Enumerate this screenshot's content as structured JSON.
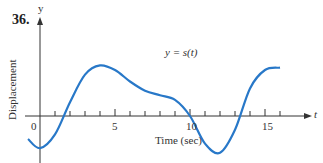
{
  "problem_number": "36.",
  "chart_data": {
    "type": "line",
    "title": "",
    "curve_label": "y = s(t)",
    "xlabel": "Time (sec)",
    "ylabel": "Displacement",
    "x_axis_name": "t",
    "y_axis_name": "y",
    "x_ticks": [
      0,
      5,
      10,
      15
    ],
    "minor_tick_step": 1,
    "xlim": [
      -1,
      17
    ],
    "series": [
      {
        "name": "s(t)",
        "color": "#2878c8",
        "x": [
          -0.8,
          0,
          1,
          2,
          3,
          4,
          5,
          6,
          7,
          8,
          9,
          10,
          11,
          12,
          13,
          14,
          15,
          16
        ],
        "y": [
          -0.5,
          -0.7,
          -0.4,
          0.3,
          0.9,
          1.1,
          1.0,
          0.75,
          0.55,
          0.45,
          0.35,
          0.0,
          -0.6,
          -0.8,
          -0.3,
          0.6,
          1.0,
          1.05
        ]
      }
    ]
  }
}
